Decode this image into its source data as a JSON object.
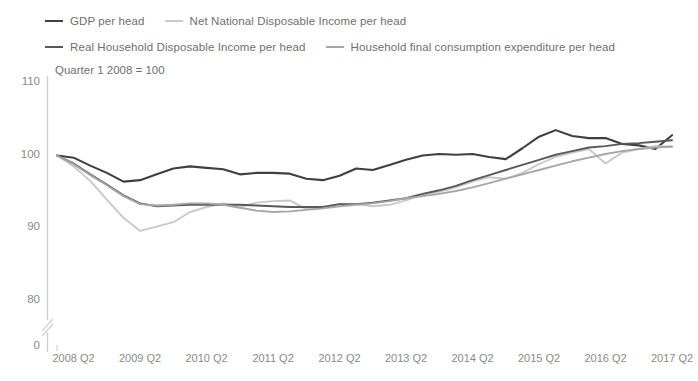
{
  "chart_data": {
    "type": "line",
    "title": "",
    "subtitle": "Quarter 1 2008 = 100",
    "xlabel": "",
    "ylabel": "",
    "ylim": [
      80,
      110
    ],
    "yticks": [
      110,
      100,
      90,
      80
    ],
    "y_axis_break": true,
    "y_axis_zero_label": "0",
    "grid": false,
    "legend_position": "top",
    "x": [
      "2008 Q1",
      "2008 Q2",
      "2008 Q3",
      "2008 Q4",
      "2009 Q1",
      "2009 Q2",
      "2009 Q3",
      "2009 Q4",
      "2010 Q1",
      "2010 Q2",
      "2010 Q3",
      "2010 Q4",
      "2011 Q1",
      "2011 Q2",
      "2011 Q3",
      "2011 Q4",
      "2012 Q1",
      "2012 Q2",
      "2012 Q3",
      "2012 Q4",
      "2013 Q1",
      "2013 Q2",
      "2013 Q3",
      "2013 Q4",
      "2014 Q1",
      "2014 Q2",
      "2014 Q3",
      "2014 Q4",
      "2015 Q1",
      "2015 Q2",
      "2015 Q3",
      "2015 Q4",
      "2016 Q1",
      "2016 Q2",
      "2016 Q3",
      "2016 Q4",
      "2017 Q1",
      "2017 Q2"
    ],
    "xticks": [
      "2008 Q2",
      "2009 Q2",
      "2010 Q2",
      "2011 Q2",
      "2012 Q2",
      "2013 Q2",
      "2014 Q2",
      "2015 Q2",
      "2016 Q2",
      "2017 Q2"
    ],
    "xtick_indices": [
      1,
      5,
      9,
      13,
      17,
      21,
      25,
      29,
      33,
      37
    ],
    "series": [
      {
        "name": "GDP per head",
        "color": "#3f3f3f",
        "width": 2.1,
        "values": [
          100.0,
          99.7,
          98.6,
          97.6,
          96.4,
          96.6,
          97.4,
          98.2,
          98.5,
          98.3,
          98.1,
          97.4,
          97.6,
          97.6,
          97.5,
          96.8,
          96.6,
          97.2,
          98.2,
          98.0,
          98.7,
          99.4,
          100.0,
          100.2,
          100.1,
          100.2,
          99.8,
          99.5,
          101.0,
          102.6,
          103.5,
          102.7,
          102.4,
          102.4,
          101.6,
          101.4,
          100.9,
          102.8
        ]
      },
      {
        "name": "Net National Disposable Income per head",
        "color": "#c9c9c9",
        "width": 1.9,
        "values": [
          100.0,
          98.5,
          96.5,
          93.9,
          91.4,
          89.6,
          90.2,
          90.8,
          92.2,
          92.9,
          93.4,
          92.9,
          93.5,
          93.7,
          93.8,
          92.6,
          92.9,
          93.3,
          93.3,
          93.0,
          93.2,
          93.8,
          94.6,
          95.0,
          95.6,
          96.4,
          97.0,
          96.8,
          97.6,
          98.8,
          99.8,
          100.4,
          100.9,
          98.9,
          100.4,
          100.9,
          101.3,
          101.3
        ]
      },
      {
        "name": "Real Household Disposable Income per head",
        "color": "#585858",
        "width": 1.9,
        "values": [
          100.0,
          98.9,
          97.4,
          96.0,
          94.5,
          93.4,
          93.0,
          93.1,
          93.2,
          93.2,
          93.2,
          93.2,
          93.1,
          93.0,
          92.9,
          92.9,
          92.9,
          93.3,
          93.3,
          93.5,
          93.8,
          94.1,
          94.7,
          95.2,
          95.8,
          96.6,
          97.3,
          98.0,
          98.7,
          99.4,
          100.1,
          100.6,
          101.1,
          101.3,
          101.6,
          101.7,
          101.9,
          102.1
        ]
      },
      {
        "name": "Household final consumption expenditure per head",
        "color": "#a6a6a6",
        "width": 1.9,
        "values": [
          100.0,
          98.8,
          97.3,
          95.9,
          94.4,
          93.3,
          93.1,
          93.2,
          93.4,
          93.4,
          93.2,
          92.8,
          92.4,
          92.2,
          92.3,
          92.5,
          92.7,
          93.0,
          93.2,
          93.4,
          93.7,
          94.1,
          94.4,
          94.7,
          95.1,
          95.6,
          96.2,
          96.8,
          97.4,
          98.0,
          98.6,
          99.2,
          99.7,
          100.2,
          100.6,
          100.9,
          101.1,
          101.2
        ]
      }
    ]
  },
  "legend": {
    "rows": [
      [
        {
          "label": "GDP per head",
          "color": "#3f3f3f"
        },
        {
          "label": "Net National Disposable Income per head",
          "color": "#c9c9c9"
        }
      ],
      [
        {
          "label": "Real Household Disposable Income per head",
          "color": "#585858"
        },
        {
          "label": "Household final consumption expenditure per head",
          "color": "#a6a6a6"
        }
      ]
    ]
  },
  "axis": {
    "line_color": "#cfcfcf",
    "tick_color": "#8a8a8a"
  }
}
